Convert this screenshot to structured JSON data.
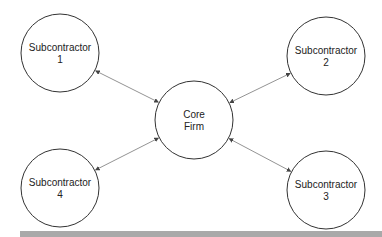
{
  "diagram": {
    "type": "hub-and-spoke network",
    "nodes": [
      {
        "id": "core",
        "line1": "Core",
        "line2": "Firm",
        "cx": 194,
        "cy": 120,
        "r": 39
      },
      {
        "id": "sub1",
        "line1": "Subcontractor",
        "line2": "1",
        "cx": 60,
        "cy": 53,
        "r": 39
      },
      {
        "id": "sub2",
        "line1": "Subcontractor",
        "line2": "2",
        "cx": 326,
        "cy": 56,
        "r": 39
      },
      {
        "id": "sub3",
        "line1": "Subcontractor",
        "line2": "3",
        "cx": 326,
        "cy": 190,
        "r": 39
      },
      {
        "id": "sub4",
        "line1": "Subcontractor",
        "line2": "4",
        "cx": 60,
        "cy": 188,
        "r": 39
      }
    ],
    "edges": [
      {
        "from": "core",
        "to": "sub1",
        "bidirectional": true
      },
      {
        "from": "core",
        "to": "sub2",
        "bidirectional": true
      },
      {
        "from": "core",
        "to": "sub3",
        "bidirectional": true
      },
      {
        "from": "core",
        "to": "sub4",
        "bidirectional": true
      }
    ],
    "colors": {
      "stroke": "#333333",
      "edge": "#777777",
      "bar": "#a9a9a9"
    }
  }
}
